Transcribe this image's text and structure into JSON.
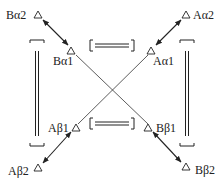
{
  "diagram": {
    "type": "subunit-interaction-diagram",
    "nodes": {
      "b_alpha2": {
        "label": "Bα2"
      },
      "b_alpha1": {
        "label": "Bα1"
      },
      "a_alpha1": {
        "label": "Aα1"
      },
      "a_alpha2": {
        "label": "Aα2"
      },
      "a_beta1": {
        "label": "Aβ1"
      },
      "b_beta1": {
        "label": "Bβ1"
      },
      "a_beta2": {
        "label": "Aβ2"
      },
      "b_beta2": {
        "label": "Bβ2"
      }
    },
    "edges": [
      {
        "from": "Bα2",
        "to": "Bα1",
        "style": "double-arrow"
      },
      {
        "from": "Aα2",
        "to": "Aα1",
        "style": "double-arrow"
      },
      {
        "from": "Aβ2",
        "to": "Aβ1",
        "style": "double-arrow"
      },
      {
        "from": "Bβ2",
        "to": "Bβ1",
        "style": "double-arrow"
      },
      {
        "from": "Bα1",
        "to": "Bβ1",
        "style": "line"
      },
      {
        "from": "Aα1",
        "to": "Aβ1",
        "style": "line"
      }
    ],
    "brackets": [
      {
        "position": "top-middle",
        "style": "double-bond-bracket"
      },
      {
        "position": "bottom-middle",
        "style": "double-bond-bracket"
      },
      {
        "position": "left-vertical",
        "style": "double-bond-bracket"
      },
      {
        "position": "right-vertical",
        "style": "double-bond-bracket"
      }
    ],
    "colors": {
      "stroke": "#222222",
      "background": "#ffffff"
    }
  }
}
